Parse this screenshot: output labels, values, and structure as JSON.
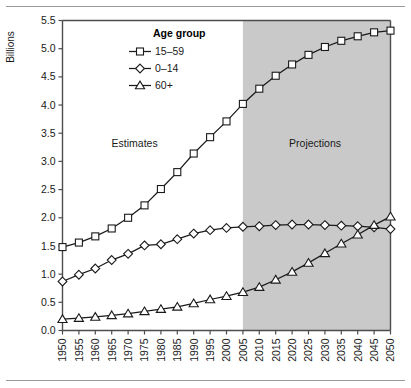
{
  "chart_data": {
    "type": "line",
    "title": "",
    "xlabel": "",
    "ylabel": "Billions",
    "xlim": [
      1950,
      2050
    ],
    "ylim": [
      0.0,
      5.5
    ],
    "grid": false,
    "legend_position": "top-center-left",
    "legend_title": "Age group",
    "x": [
      1950,
      1955,
      1960,
      1965,
      1970,
      1975,
      1980,
      1985,
      1990,
      1995,
      2000,
      2005,
      2010,
      2015,
      2020,
      2025,
      2030,
      2035,
      2040,
      2045,
      2050
    ],
    "xtick_labels": [
      "1950",
      "1955",
      "1960",
      "1965",
      "1970",
      "1975",
      "1980",
      "1985",
      "1990",
      "1995",
      "2000",
      "2005",
      "2010",
      "2015",
      "2020",
      "2025",
      "2030",
      "2035",
      "2040",
      "2045",
      "2050"
    ],
    "ytick_labels": [
      "0.0",
      "0.5",
      "1.0",
      "1.5",
      "2.0",
      "2.5",
      "3.0",
      "3.5",
      "4.0",
      "4.5",
      "5.0",
      "5.5"
    ],
    "ytick_values": [
      0.0,
      0.5,
      1.0,
      1.5,
      2.0,
      2.5,
      3.0,
      3.5,
      4.0,
      4.5,
      5.0,
      5.5
    ],
    "series": [
      {
        "name": "15–59",
        "marker": "square",
        "values": [
          1.48,
          1.56,
          1.67,
          1.81,
          2.0,
          2.22,
          2.51,
          2.81,
          3.14,
          3.43,
          3.71,
          4.02,
          4.29,
          4.52,
          4.72,
          4.89,
          5.03,
          5.14,
          5.22,
          5.29,
          5.32
        ]
      },
      {
        "name": "0–14",
        "marker": "diamond",
        "values": [
          0.87,
          0.99,
          1.1,
          1.25,
          1.36,
          1.51,
          1.53,
          1.62,
          1.72,
          1.78,
          1.82,
          1.84,
          1.85,
          1.87,
          1.88,
          1.88,
          1.87,
          1.86,
          1.85,
          1.83,
          1.8
        ]
      },
      {
        "name": "60+",
        "marker": "triangle",
        "values": [
          0.2,
          0.22,
          0.24,
          0.27,
          0.3,
          0.34,
          0.38,
          0.42,
          0.48,
          0.55,
          0.61,
          0.68,
          0.77,
          0.9,
          1.04,
          1.2,
          1.37,
          1.54,
          1.7,
          1.87,
          2.02
        ]
      }
    ],
    "annotations": [
      {
        "text": "Estimates",
        "x": 1972,
        "y": 3.25
      },
      {
        "text": "Projections",
        "x": 2027,
        "y": 3.25
      }
    ],
    "shaded_region": {
      "label": "Projections",
      "x_start": 2005,
      "x_end": 2050,
      "color": "#c9c9c9"
    }
  },
  "legend": {
    "title": "Age group",
    "entries": [
      {
        "label": "15–59",
        "marker": "square"
      },
      {
        "label": "0–14",
        "marker": "diamond"
      },
      {
        "label": "60+",
        "marker": "triangle"
      }
    ]
  },
  "axis": {
    "y_title": "Billions"
  },
  "colors": {
    "line": "#1a1a1a",
    "marker_fill": "#ffffff",
    "shade": "#c9c9c9",
    "axis": "#4d4d4d",
    "rule": "#9a9a9a"
  }
}
